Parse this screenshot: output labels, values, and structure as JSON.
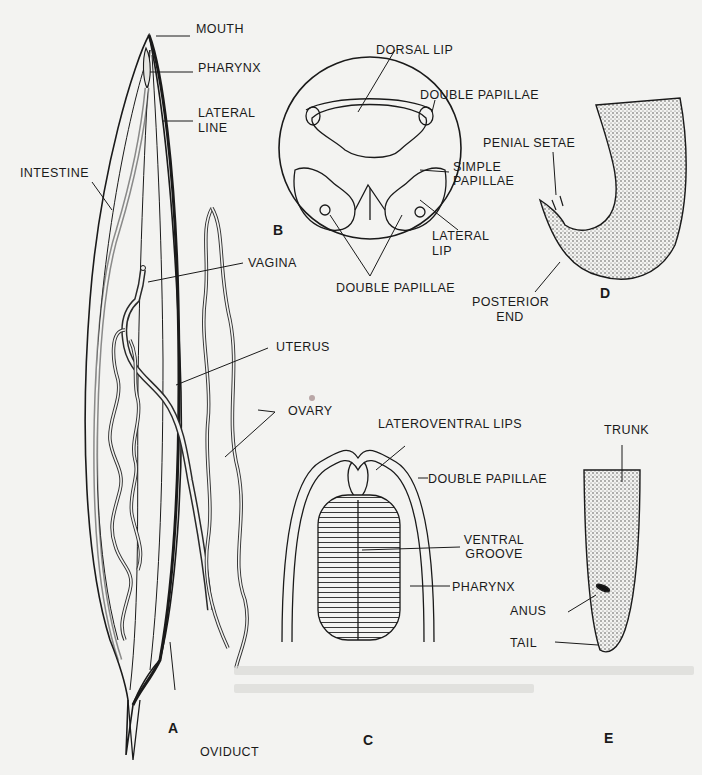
{
  "figure": {
    "panels": {
      "A": "A",
      "B": "B",
      "C": "C",
      "D": "D",
      "E": "E"
    },
    "panel_A_labels": {
      "mouth": "MOUTH",
      "pharynx": "PHARYNX",
      "lateral_line_1": "LATERAL",
      "lateral_line_2": "LINE",
      "intestine": "INTESTINE",
      "vagina": "VAGINA",
      "uterus": "UTERUS",
      "ovary": "OVARY",
      "oviduct": "OVIDUCT"
    },
    "panel_B_labels": {
      "dorsal_lip": "DORSAL LIP",
      "double_papillae_top": "DOUBLE PAPILLAE",
      "simple_papillae_1": "SIMPLE",
      "simple_papillae_2": "PAPILLAE",
      "lateral_lip_1": "LATERAL",
      "lateral_lip_2": "LIP",
      "double_papillae_bottom": "DOUBLE PAPILLAE"
    },
    "panel_C_labels": {
      "lateroventral_lips": "LATEROVENTRAL LIPS",
      "double_papillae": "DOUBLE PAPILLAE",
      "ventral_groove_1": "VENTRAL",
      "ventral_groove_2": "GROOVE",
      "pharynx": "PHARYNX"
    },
    "panel_D_labels": {
      "penial_setae": "PENIAL SETAE",
      "posterior_end_1": "POSTERIOR",
      "posterior_end_2": "END"
    },
    "panel_E_labels": {
      "trunk": "TRUNK",
      "anus": "ANUS",
      "tail": "TAIL"
    }
  },
  "colors": {
    "ink": "#1a1a1a",
    "paper": "#f3f3f1",
    "show_through": "#d9d9d6"
  }
}
